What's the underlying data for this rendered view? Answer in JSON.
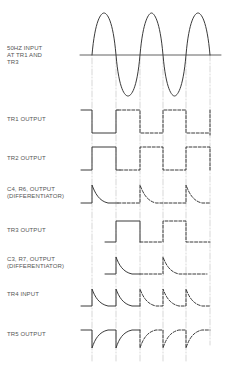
{
  "diagram": {
    "title": "",
    "colors": {
      "line": "#3a3a3a",
      "guide": "#b5b5b5",
      "text": "#555555"
    },
    "labels": [
      {
        "id": "input",
        "text": "50HZ INPUT\nAT TR1 AND\nTR3",
        "y": 47
      },
      {
        "id": "tr1",
        "text": "TR1 OUTPUT",
        "y": 117
      },
      {
        "id": "tr2",
        "text": "TR2 OUTPUT",
        "y": 157
      },
      {
        "id": "c4r6",
        "text": "C4, R6, OUTPUT\n(DIFFERENTIATOR)",
        "y": 188
      },
      {
        "id": "tr3",
        "text": "TR3 OUTPUT",
        "y": 229
      },
      {
        "id": "c3r7",
        "text": "C3, R7, OUTPUT\n(DIFFERENTIATOR)",
        "y": 257
      },
      {
        "id": "tr4",
        "text": "TR4 INPUT",
        "y": 293
      },
      {
        "id": "tr5",
        "text": "TR5 OUTPUT",
        "y": 333
      }
    ],
    "guide_x": [
      92,
      116,
      140,
      163,
      186,
      210
    ],
    "waveforms": [
      {
        "id": "sine",
        "name": "50Hz input",
        "type": "sine"
      },
      {
        "id": "tr1",
        "name": "TR1 output",
        "type": "square"
      },
      {
        "id": "tr2",
        "name": "TR2 output",
        "type": "square-inverted"
      },
      {
        "id": "c4r6",
        "name": "C4, R6 output",
        "type": "positive-spikes"
      },
      {
        "id": "tr3",
        "name": "TR3 output",
        "type": "square-half-rate"
      },
      {
        "id": "c3r7",
        "name": "C3, R7 output",
        "type": "positive-spikes"
      },
      {
        "id": "tr4",
        "name": "TR4 input",
        "type": "positive-spikes"
      },
      {
        "id": "tr5",
        "name": "TR5 output",
        "type": "negative-spikes"
      }
    ]
  }
}
